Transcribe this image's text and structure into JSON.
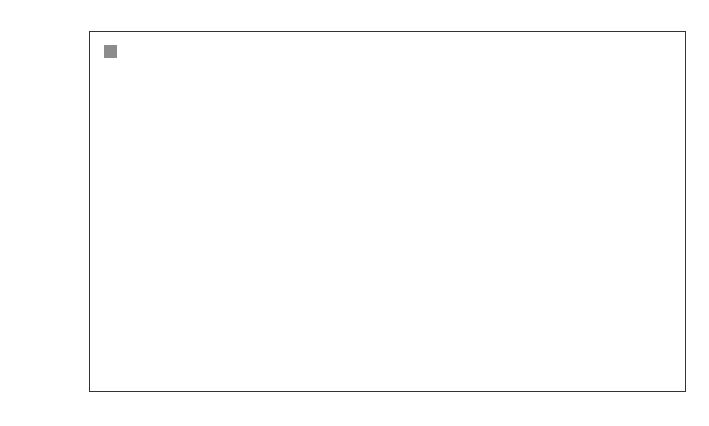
{
  "chart_data": {
    "type": "bar",
    "title": "",
    "xlabel": "",
    "ylabel": "Cost of storage (£/tCO2 stored)",
    "ylabel_parts": {
      "pre": "Cost of storage (£/tCO",
      "sub": "2",
      "post": " stored)"
    },
    "ylim": [
      -10,
      4
    ],
    "yticks": [
      4,
      2,
      0,
      -2,
      -4,
      -6,
      -8,
      -10
    ],
    "ytick_labels": [
      "4",
      "2",
      "0",
      "−2",
      "−4",
      "−6",
      "−8",
      "−10"
    ],
    "grid": false,
    "legend": {
      "position": "upper left",
      "entries": [
        "Range"
      ]
    },
    "categories": [
      "Depleted gas fields",
      "EOR"
    ],
    "category_labels": [
      [
        "Depleted",
        "gas fields"
      ],
      [
        "EOR"
      ]
    ],
    "series": [
      {
        "name": "Base cost",
        "color": "#050505",
        "values": [
          0.75,
          -7.9
        ]
      },
      {
        "name": "Range",
        "color": "#8c8c8c",
        "low": [
          0.75,
          0
        ],
        "high": [
          1.6,
          1.6
        ]
      }
    ]
  }
}
